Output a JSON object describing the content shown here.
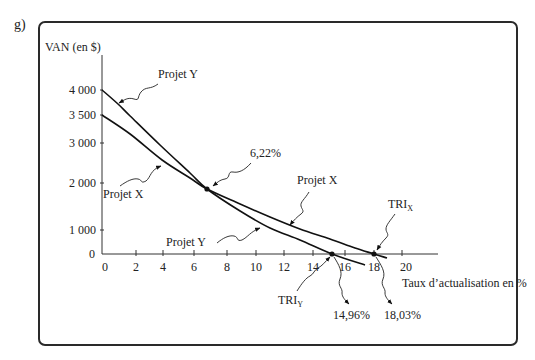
{
  "figure": {
    "label": "g)"
  },
  "chart_data": {
    "type": "line",
    "title": "",
    "xlabel": "Taux d’actualisation en %",
    "ylabel": "VAN (en $)",
    "xlim": [
      0,
      20
    ],
    "ylim": [
      0,
      4000
    ],
    "grid": false,
    "legend": null,
    "x_ticks": [
      "0",
      "2",
      "4",
      "6",
      "8",
      "10",
      "12",
      "14",
      "16",
      "18",
      "20"
    ],
    "y_ticks": [
      "0",
      "1 000",
      "2 000",
      "3 000",
      "3 500",
      "4 000"
    ],
    "series": [
      {
        "name": "Projet Y",
        "npv_at_0": 4000,
        "irr": 14.96,
        "points": [
          [
            0,
            4000
          ],
          [
            0.94,
            3720
          ],
          [
            1.65,
            3482
          ],
          [
            3.78,
            2950
          ],
          [
            5.74,
            2250
          ],
          [
            6.79,
            1872
          ],
          [
            8.9,
            1404
          ],
          [
            11.0,
            1043
          ],
          [
            13.1,
            583
          ],
          [
            15.19,
            0
          ],
          [
            17.38,
            -458
          ]
        ]
      },
      {
        "name": "Projet X",
        "npv_at_0": 3500,
        "irr": 18.03,
        "points": [
          [
            0,
            3500
          ],
          [
            1.65,
            3161
          ],
          [
            3.93,
            2575
          ],
          [
            5.74,
            2125
          ],
          [
            6.79,
            1872
          ],
          [
            8.9,
            1553
          ],
          [
            11.0,
            1277
          ],
          [
            13.1,
            1021
          ],
          [
            15.06,
            625
          ],
          [
            16.69,
            250
          ],
          [
            18,
            0
          ],
          [
            18.93,
            -167
          ]
        ]
      }
    ],
    "annotations": [
      {
        "id": "label-y-top",
        "text": "Projet Y"
      },
      {
        "id": "label-x-left",
        "text": "Projet X"
      },
      {
        "id": "crossover",
        "text": "6,22%",
        "value": 6.22,
        "marker": [
          6.79,
          1872
        ]
      },
      {
        "id": "label-x-right",
        "text": "Projet X"
      },
      {
        "id": "label-y-bottom",
        "text": "Projet Y"
      },
      {
        "id": "tri-x",
        "text": "TRI",
        "sub": "X",
        "value": 18.03,
        "marker": [
          18,
          0
        ]
      },
      {
        "id": "tri-y",
        "text": "TRI",
        "sub": "Y",
        "value": 14.96,
        "marker": [
          15.19,
          0
        ]
      },
      {
        "id": "tri-y-value",
        "text": "14,96%"
      },
      {
        "id": "tri-x-value",
        "text": "18,03%"
      }
    ]
  }
}
